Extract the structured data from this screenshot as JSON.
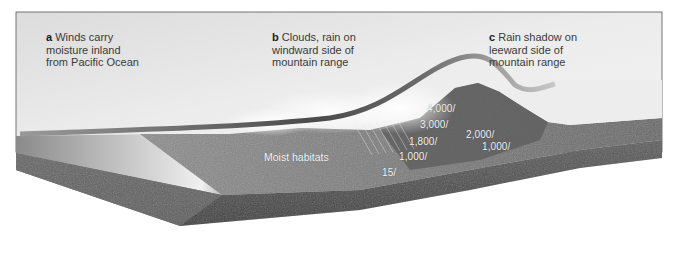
{
  "diagram": {
    "captions": [
      {
        "letter": "a",
        "lines": [
          "Winds carry",
          "moisture inland",
          "from Pacific Ocean"
        ]
      },
      {
        "letter": "b",
        "lines": [
          "Clouds, rain on",
          "windward side of",
          "mountain range"
        ]
      },
      {
        "letter": "c",
        "lines": [
          "Rain shadow on",
          "leeward side of",
          "mountain range"
        ]
      }
    ],
    "habitat_label": "Moist habitats",
    "windward_elevations": [
      {
        "label": "4,000/"
      },
      {
        "label": "3,000/"
      },
      {
        "label": "1,800/"
      },
      {
        "label": "1,000/"
      },
      {
        "label": "15/"
      }
    ],
    "leeward_elevations": [
      {
        "label": "2,000/"
      },
      {
        "label": "1,000/"
      }
    ],
    "colors": {
      "sky_panel": "#e4e4e4",
      "ocean": "#cfcfcf",
      "terrain": "#7a7a7a",
      "terrain_dark": "#4a4a4a",
      "wind_ribbon": "#6d6d6d",
      "caption_text": "#3a3a3a"
    }
  }
}
